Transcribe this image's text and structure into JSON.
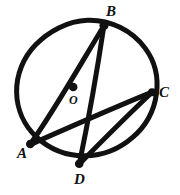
{
  "figure": {
    "kind": "circle-geometry-diagram",
    "style": "hand-drawn-black-ink",
    "background_color": "#ffffff",
    "ink_color": "#111111",
    "canvas": {
      "width": 180,
      "height": 195
    },
    "circle": {
      "name": "main-circle",
      "center_x": 87,
      "center_y": 90,
      "radius": 70,
      "stroke_width": 5
    },
    "center_point": {
      "label": "O",
      "dot_x": 73,
      "dot_y": 87,
      "dot_radius": 4.2
    },
    "points": [
      {
        "id": "B",
        "label": "B",
        "x": 104,
        "y": 25,
        "dot_radius": 4.0
      },
      {
        "id": "C",
        "label": "C",
        "x": 152,
        "y": 92,
        "dot_radius": 3.6
      },
      {
        "id": "A",
        "label": "A",
        "x": 30,
        "y": 144,
        "dot_radius": 3.8
      },
      {
        "id": "D",
        "label": "D",
        "x": 79,
        "y": 164,
        "dot_radius": 3.8
      }
    ],
    "chords": [
      {
        "name": "chord-AB",
        "from": "A",
        "to": "B",
        "stroke_width": 5
      },
      {
        "name": "chord-AC",
        "from": "A",
        "to": "C",
        "stroke_width": 5
      },
      {
        "name": "chord-BD",
        "from": "B",
        "to": "D",
        "stroke_width": 5
      },
      {
        "name": "chord-DC",
        "from": "D",
        "to": "C",
        "stroke_width": 5
      }
    ]
  }
}
